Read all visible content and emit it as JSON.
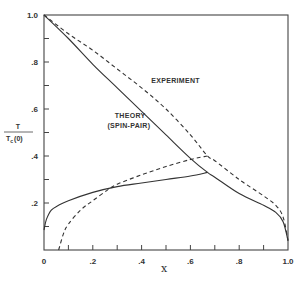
{
  "chart_data": {
    "type": "line",
    "title": "",
    "xlabel": "x",
    "ylabel": "T / T_c(0)",
    "ylabel_numerator": "T",
    "ylabel_denominator": "T",
    "ylabel_denominator_sub": "c",
    "ylabel_denominator_suffix": "(0)",
    "xlim": [
      0,
      1.0
    ],
    "ylim": [
      0,
      1.0
    ],
    "grid": false,
    "legend": "none (inline annotations)",
    "x_ticks": [
      0,
      0.1,
      0.2,
      0.3,
      0.4,
      0.5,
      0.6,
      0.7,
      0.8,
      0.9,
      1.0
    ],
    "x_tick_labels": [
      "0",
      "",
      ".2",
      "",
      ".4",
      "",
      ".6",
      "",
      ".8",
      "",
      "1.0"
    ],
    "y_ticks": [
      0,
      0.1,
      0.2,
      0.3,
      0.4,
      0.5,
      0.6,
      0.7,
      0.8,
      0.9,
      1.0
    ],
    "y_tick_labels": [
      "",
      "",
      ".2",
      "",
      ".4",
      "",
      ".6",
      "",
      ".8",
      "",
      "1.0"
    ],
    "annotations": [
      {
        "text": "EXPERIMENT",
        "x": 0.44,
        "y": 0.71
      },
      {
        "text": "THEORY",
        "x": 0.29,
        "y": 0.56
      },
      {
        "text": "(SPIN-PAIR)",
        "x": 0.26,
        "y": 0.52
      }
    ],
    "series": [
      {
        "name": "Theory (spin-pair) upper branch",
        "style": "solid",
        "points": [
          [
            0,
            1.0
          ],
          [
            0.1,
            0.9
          ],
          [
            0.2,
            0.79
          ],
          [
            0.3,
            0.69
          ],
          [
            0.4,
            0.59
          ],
          [
            0.5,
            0.49
          ],
          [
            0.6,
            0.39
          ],
          [
            0.67,
            0.33
          ],
          [
            0.7,
            0.31
          ],
          [
            0.8,
            0.24
          ],
          [
            0.9,
            0.19
          ],
          [
            0.95,
            0.16
          ],
          [
            0.98,
            0.12
          ],
          [
            1.0,
            0.04
          ]
        ]
      },
      {
        "name": "Theory (spin-pair) lower branch",
        "style": "solid",
        "points": [
          [
            0,
            0.085
          ],
          [
            0.01,
            0.13
          ],
          [
            0.03,
            0.17
          ],
          [
            0.06,
            0.19
          ],
          [
            0.1,
            0.21
          ],
          [
            0.2,
            0.245
          ],
          [
            0.3,
            0.27
          ],
          [
            0.4,
            0.285
          ],
          [
            0.5,
            0.3
          ],
          [
            0.6,
            0.315
          ],
          [
            0.67,
            0.33
          ]
        ]
      },
      {
        "name": "Experiment upper branch",
        "style": "dashed",
        "points": [
          [
            0,
            1.0
          ],
          [
            0.1,
            0.92
          ],
          [
            0.2,
            0.85
          ],
          [
            0.3,
            0.77
          ],
          [
            0.4,
            0.69
          ],
          [
            0.5,
            0.6
          ],
          [
            0.6,
            0.49
          ],
          [
            0.67,
            0.4
          ],
          [
            0.7,
            0.38
          ],
          [
            0.8,
            0.3
          ],
          [
            0.9,
            0.23
          ],
          [
            0.95,
            0.19
          ],
          [
            0.98,
            0.14
          ],
          [
            1.0,
            0.04
          ]
        ]
      },
      {
        "name": "Experiment lower branch",
        "style": "dashed",
        "points": [
          [
            0.06,
            0
          ],
          [
            0.08,
            0.07
          ],
          [
            0.1,
            0.11
          ],
          [
            0.15,
            0.17
          ],
          [
            0.2,
            0.21
          ],
          [
            0.26,
            0.255
          ],
          [
            0.3,
            0.28
          ],
          [
            0.4,
            0.32
          ],
          [
            0.5,
            0.355
          ],
          [
            0.6,
            0.385
          ],
          [
            0.67,
            0.4
          ]
        ]
      }
    ]
  },
  "colors": {
    "line": "#333333",
    "axis": "#444444",
    "background": "#ffffff"
  }
}
